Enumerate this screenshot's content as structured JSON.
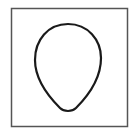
{
  "figure": {
    "frame": {
      "x": 11,
      "y": 8,
      "width": 117,
      "height": 119,
      "stroke": "#555555"
    },
    "shape": {
      "type": "egg-outline",
      "top_y": 24,
      "bottom_y": 112,
      "left_x": 35,
      "right_x": 101,
      "stroke": "#1a1a1a"
    }
  }
}
